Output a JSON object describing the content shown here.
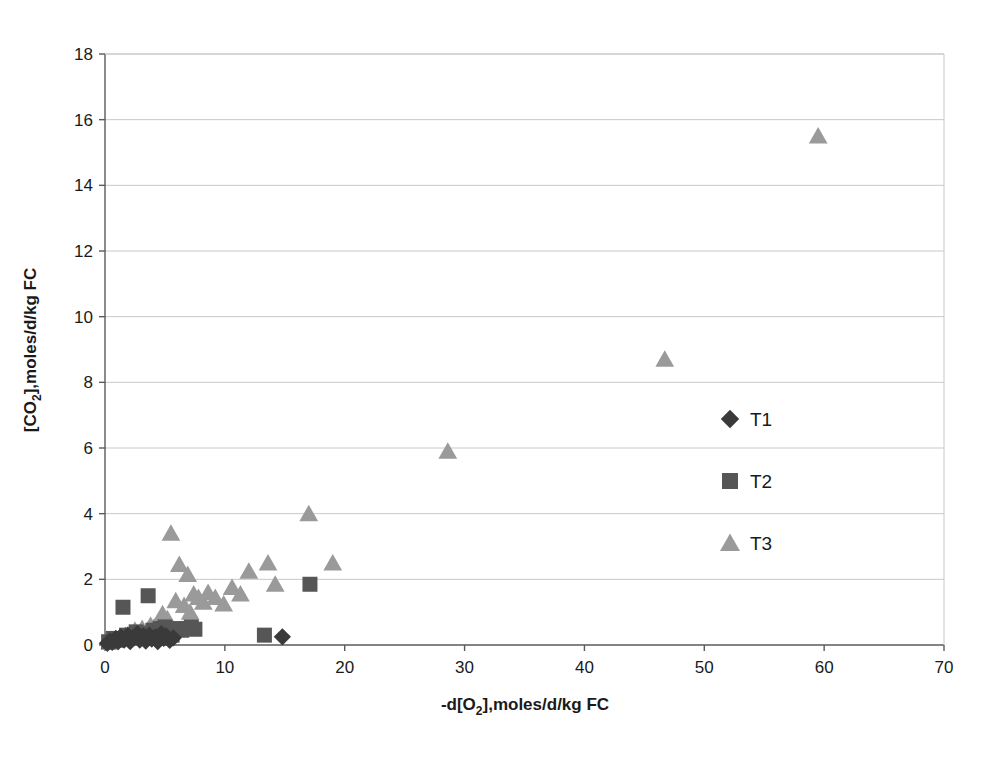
{
  "chart_data": {
    "type": "scatter",
    "title": "",
    "xlabel": "-d[O2],moles/d/kg FC",
    "xlabel_parts": {
      "pre": "-d[O",
      "sub": "2",
      "post": "],moles/d/kg FC"
    },
    "ylabel": "[CO2],moles/d/kg FC",
    "ylabel_parts": {
      "pre": "[CO",
      "sub": "2",
      "post": "],moles/d/kg FC"
    },
    "xlim": [
      0,
      70
    ],
    "ylim": [
      0,
      18
    ],
    "xticks": [
      0,
      10,
      20,
      30,
      40,
      50,
      60,
      70
    ],
    "yticks": [
      0,
      2,
      4,
      6,
      8,
      10,
      12,
      14,
      16,
      18
    ],
    "grid": "horizontal",
    "legend_position": "inside-right",
    "series": [
      {
        "name": "T1",
        "marker": "diamond",
        "color": "#3a3a3a",
        "points": [
          [
            0.2,
            0.05
          ],
          [
            0.4,
            0.12
          ],
          [
            0.6,
            0.08
          ],
          [
            0.9,
            0.2
          ],
          [
            1.1,
            0.1
          ],
          [
            1.3,
            0.25
          ],
          [
            1.6,
            0.15
          ],
          [
            1.9,
            0.3
          ],
          [
            2.1,
            0.1
          ],
          [
            2.4,
            0.22
          ],
          [
            2.7,
            0.35
          ],
          [
            2.9,
            0.15
          ],
          [
            3.2,
            0.28
          ],
          [
            3.4,
            0.12
          ],
          [
            3.7,
            0.3
          ],
          [
            3.9,
            0.18
          ],
          [
            4.2,
            0.25
          ],
          [
            4.4,
            0.1
          ],
          [
            4.7,
            0.35
          ],
          [
            4.9,
            0.2
          ],
          [
            5.1,
            0.28
          ],
          [
            5.4,
            0.14
          ],
          [
            5.7,
            0.22
          ],
          [
            14.8,
            0.25
          ]
        ]
      },
      {
        "name": "T2",
        "marker": "square",
        "color": "#565656",
        "points": [
          [
            0.3,
            0.1
          ],
          [
            0.7,
            0.2
          ],
          [
            1.0,
            0.15
          ],
          [
            1.5,
            1.15
          ],
          [
            1.8,
            0.3
          ],
          [
            2.2,
            0.25
          ],
          [
            2.6,
            0.4
          ],
          [
            3.0,
            0.35
          ],
          [
            3.3,
            0.2
          ],
          [
            3.6,
            1.5
          ],
          [
            4.0,
            0.45
          ],
          [
            4.3,
            0.3
          ],
          [
            4.6,
            0.5
          ],
          [
            5.0,
            0.55
          ],
          [
            5.3,
            0.4
          ],
          [
            5.6,
            0.3
          ],
          [
            6.0,
            0.5
          ],
          [
            6.4,
            0.45
          ],
          [
            6.8,
            0.5
          ],
          [
            7.2,
            0.55
          ],
          [
            7.5,
            0.48
          ],
          [
            13.3,
            0.3
          ],
          [
            17.1,
            1.85
          ]
        ]
      },
      {
        "name": "T3",
        "marker": "triangle",
        "color": "#9a9a9a",
        "points": [
          [
            0.4,
            0.08
          ],
          [
            0.8,
            0.15
          ],
          [
            1.2,
            0.2
          ],
          [
            1.7,
            0.3
          ],
          [
            2.0,
            0.25
          ],
          [
            2.5,
            0.45
          ],
          [
            2.8,
            0.35
          ],
          [
            3.1,
            0.5
          ],
          [
            3.5,
            0.4
          ],
          [
            3.8,
            0.6
          ],
          [
            4.1,
            0.55
          ],
          [
            4.5,
            0.75
          ],
          [
            4.8,
            0.95
          ],
          [
            5.2,
            0.8
          ],
          [
            5.5,
            3.4
          ],
          [
            5.9,
            1.35
          ],
          [
            6.2,
            2.45
          ],
          [
            6.6,
            1.2
          ],
          [
            6.9,
            2.15
          ],
          [
            7.1,
            1.0
          ],
          [
            7.4,
            1.55
          ],
          [
            7.8,
            1.45
          ],
          [
            8.2,
            1.3
          ],
          [
            8.6,
            1.6
          ],
          [
            9.2,
            1.45
          ],
          [
            9.9,
            1.25
          ],
          [
            10.6,
            1.75
          ],
          [
            11.3,
            1.55
          ],
          [
            12.0,
            2.25
          ],
          [
            13.6,
            2.5
          ],
          [
            14.2,
            1.85
          ],
          [
            17.0,
            4.0
          ],
          [
            19.0,
            2.5
          ],
          [
            28.6,
            5.9
          ],
          [
            46.7,
            8.7
          ],
          [
            59.5,
            15.5
          ]
        ]
      }
    ]
  },
  "legend": {
    "items": [
      {
        "label": "T1",
        "marker": "diamond",
        "color": "#3a3a3a"
      },
      {
        "label": "T2",
        "marker": "square",
        "color": "#565656"
      },
      {
        "label": "T3",
        "marker": "triangle",
        "color": "#9a9a9a"
      }
    ]
  },
  "plot_area": {
    "left": 105,
    "top": 54,
    "right": 944,
    "bottom": 645
  },
  "colors": {
    "axis": "#5a5a5a",
    "grid": "#c8c8c8",
    "text": "#1a1a1a",
    "background": "#ffffff"
  }
}
